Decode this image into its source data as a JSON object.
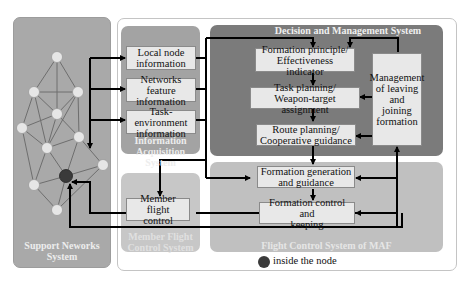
{
  "support_networks": {
    "title": "Support Neworks System",
    "title_line1": "Support Neworks",
    "title_line2": "System",
    "nodes": [
      {
        "id": "n1",
        "x": 57,
        "y": 57
      },
      {
        "id": "n2",
        "x": 34,
        "y": 92
      },
      {
        "id": "n3",
        "x": 78,
        "y": 92
      },
      {
        "id": "n4",
        "x": 57,
        "y": 114
      },
      {
        "id": "n5",
        "x": 22,
        "y": 128
      },
      {
        "id": "n6",
        "x": 79,
        "y": 137
      },
      {
        "id": "n7",
        "x": 47,
        "y": 148
      },
      {
        "id": "n8",
        "x": 103,
        "y": 165
      },
      {
        "id": "n9",
        "x": 66,
        "y": 176,
        "inside": true
      },
      {
        "id": "n10",
        "x": 34,
        "y": 185
      },
      {
        "id": "n11",
        "x": 57,
        "y": 210
      }
    ]
  },
  "information_acquisition": {
    "title_line1": "Information",
    "title_line2": "Acquisition System",
    "boxes": [
      {
        "line1": "Local node",
        "line2": "information"
      },
      {
        "line1": "Networks feature",
        "line2": "information"
      },
      {
        "line1": "Task-environment",
        "line2": "information"
      }
    ]
  },
  "decision_management": {
    "title": "Decision and Management System",
    "boxes": [
      {
        "line1": "Formation principle/",
        "line2": "Effectiveness indicator"
      },
      {
        "line1": "Task planning/",
        "line2": "Weapon-target assignment"
      },
      {
        "line1": "Route planning/",
        "line2": "Cooperative guidance"
      }
    ],
    "side_box": {
      "line1": "Management",
      "line2": "of leaving",
      "line3": "and joining",
      "line4": "formation"
    }
  },
  "member_flight_control": {
    "title_line1": "Member Flight",
    "title_line2": "Control System",
    "box": {
      "line1": "Member flight",
      "line2": "control"
    }
  },
  "flight_control_maf": {
    "title": "Flight Control System of MAF",
    "boxes": [
      {
        "line1": "Formation generation",
        "line2": "and guidance"
      },
      {
        "line1": "Formation control and",
        "line2": "keeping"
      }
    ]
  },
  "legend": {
    "label": "inside the node",
    "marker_color": "#3a3a3a"
  },
  "colors": {
    "support_bg": "#a9a9a9",
    "decision_bg": "#7b7b7b",
    "info_bg": "#a3a3a3",
    "flight_bg": "#c0c0c0",
    "box_bg": "#e8e8e8",
    "node_fill": "#e6e6e6",
    "inside_node": "#3a3a3a"
  }
}
